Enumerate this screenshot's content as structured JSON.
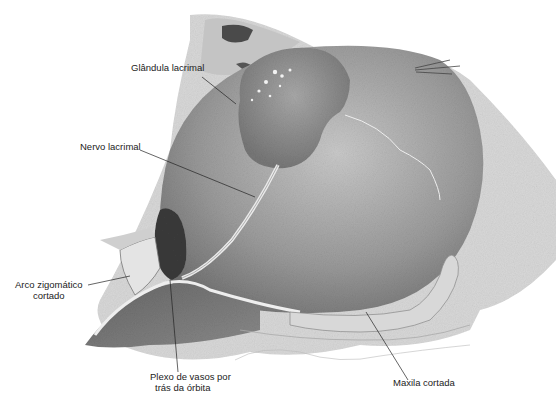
{
  "figure": {
    "labels": [
      {
        "id": "glandula",
        "text": "Glândula lacrimal"
      },
      {
        "id": "nervo",
        "text": "Nervo lacrimal"
      },
      {
        "id": "arco",
        "line1": "Arco zigomático",
        "line2": "cortado"
      },
      {
        "id": "plexo",
        "line1": "Plexo de vasos por",
        "line2": "trás da órbita"
      },
      {
        "id": "maxila",
        "text": "Maxila cortada"
      }
    ]
  }
}
